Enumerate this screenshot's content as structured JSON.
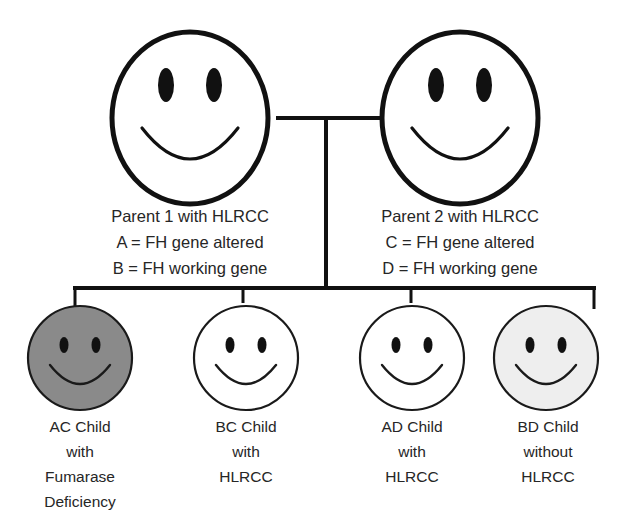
{
  "diagram": {
    "generation_1_label": "Parents",
    "generation_2_label": "Children"
  },
  "colors": {
    "outline": "#111111",
    "text": "#262626",
    "background": "#ffffff",
    "affected_fill": "#8a8a8a",
    "unaffected_fill": "#ffffff",
    "carrier_fill": "#eeeeee"
  },
  "parents": [
    {
      "id": "parent-1",
      "icon": "smiley-face-icon",
      "fill": "#ffffff",
      "lines": [
        "Parent 1 with HLRCC",
        "A = FH gene altered",
        "B = FH working gene"
      ]
    },
    {
      "id": "parent-2",
      "icon": "smiley-face-icon",
      "fill": "#ffffff",
      "lines": [
        "Parent 2 with HLRCC",
        "C = FH gene altered",
        "D = FH working gene"
      ]
    }
  ],
  "children": [
    {
      "id": "child-ac",
      "icon": "smiley-face-icon",
      "fill": "#8a8a8a",
      "genotype": "AC",
      "lines": [
        "AC Child",
        "with",
        "Fumarase",
        "Deficiency"
      ]
    },
    {
      "id": "child-bc",
      "icon": "smiley-face-icon",
      "fill": "#ffffff",
      "genotype": "BC",
      "lines": [
        "BC Child",
        "with",
        "HLRCC"
      ]
    },
    {
      "id": "child-ad",
      "icon": "smiley-face-icon",
      "fill": "#ffffff",
      "genotype": "AD",
      "lines": [
        "AD Child",
        "with",
        "HLRCC"
      ]
    },
    {
      "id": "child-bd",
      "icon": "smiley-face-icon",
      "fill": "#eeeeee",
      "genotype": "BD",
      "lines": [
        "BD Child",
        "without",
        "HLRCC"
      ]
    }
  ]
}
